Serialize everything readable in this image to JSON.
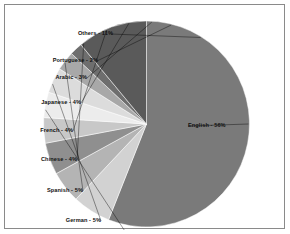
{
  "chart_data": {
    "type": "pie",
    "title": "",
    "subtitle": "",
    "xlabel": "",
    "ylabel": "",
    "legend_position": "none",
    "grid": false,
    "labels_show_percent": true,
    "start_angle_deg": 0,
    "direction": "clockwise",
    "categories": [
      "English",
      "Russian",
      "German",
      "Spanish",
      "Chinese",
      "French",
      "Japanese",
      "Arabic",
      "Portuguese",
      "Others"
    ],
    "values": [
      56,
      6,
      5,
      5,
      4,
      4,
      4,
      3,
      2,
      11
    ],
    "slices": [
      {
        "name": "English",
        "value": 56,
        "label": "English - 56%",
        "color": "#7a7a7a"
      },
      {
        "name": "Russian",
        "value": 6,
        "label": "Russian - 6%",
        "color": "#d2d2d2"
      },
      {
        "name": "German",
        "value": 5,
        "label": "German - 5%",
        "color": "#b4b4b4"
      },
      {
        "name": "Spanish",
        "value": 5,
        "label": "Spanish - 5%",
        "color": "#8f8f8f"
      },
      {
        "name": "Chinese",
        "value": 4,
        "label": "Chinese - 4%",
        "color": "#c8c8c8"
      },
      {
        "name": "French",
        "value": 4,
        "label": "French - 4%",
        "color": "#ececec"
      },
      {
        "name": "Japanese",
        "value": 4,
        "label": "Japanese - 4%",
        "color": "#dcdcdc"
      },
      {
        "name": "Arabic",
        "value": 3,
        "label": "Arabic - 3%",
        "color": "#a8a8a8"
      },
      {
        "name": "Portuguese",
        "value": 2,
        "label": "Portuguese - 2%",
        "color": "#6e6e6e"
      },
      {
        "name": "Others",
        "value": 11,
        "label": "Others - 11%",
        "color": "#5a5a5a"
      }
    ],
    "total": 100,
    "units": "percent"
  },
  "frame": {
    "border_color": "#8a8a8a",
    "background": "#ffffff"
  }
}
